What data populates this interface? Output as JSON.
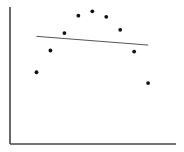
{
  "chart_data": {
    "type": "scatter",
    "title": "",
    "xlabel": "",
    "ylabel": "",
    "grid": false,
    "legend": null,
    "points": [
      {
        "x": 1,
        "y": 4.6
      },
      {
        "x": 2,
        "y": 6.6
      },
      {
        "x": 3,
        "y": 8.2
      },
      {
        "x": 4,
        "y": 9.8
      },
      {
        "x": 5,
        "y": 10.2
      },
      {
        "x": 6,
        "y": 9.7
      },
      {
        "x": 7,
        "y": 8.5
      },
      {
        "x": 8,
        "y": 6.5
      },
      {
        "x": 9,
        "y": 3.6
      }
    ],
    "trendline": {
      "type": "linear",
      "start": {
        "x": 1,
        "y": 7.9
      },
      "end": {
        "x": 9,
        "y": 7.1
      }
    },
    "xlim": [
      -0.9,
      11
    ],
    "ylim": [
      -2.0,
      10.6
    ]
  },
  "colors": {
    "axis": "#444444",
    "point": "#111111",
    "trendline": "#555555",
    "background": "#ffffff"
  }
}
